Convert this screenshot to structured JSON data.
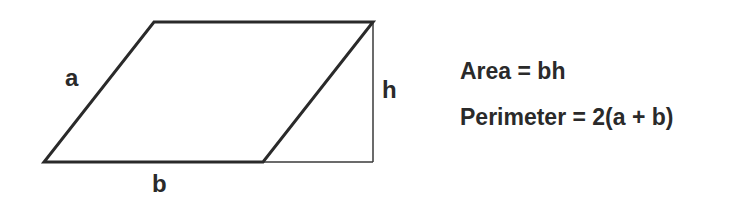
{
  "diagram": {
    "shape": {
      "type": "parallelogram",
      "vertices": {
        "top_left": [
          154,
          22
        ],
        "top_right": [
          373,
          22
        ],
        "bottom_right": [
          263,
          162
        ],
        "bottom_left": [
          44,
          162
        ]
      },
      "stroke_color": "#2a2a2a",
      "stroke_width": 3
    },
    "height_guide": {
      "vertical": {
        "x": 373,
        "y1": 22,
        "y2": 162
      },
      "base_extension": {
        "x1": 263,
        "x2": 373,
        "y": 162
      },
      "stroke_color": "#3a3a3a",
      "stroke_width": 1.5
    },
    "labels": {
      "side_a": "a",
      "base_b": "b",
      "height_h": "h"
    }
  },
  "formulas": {
    "area": "Area = bh",
    "perimeter": "Perimeter = 2(a + b)"
  }
}
